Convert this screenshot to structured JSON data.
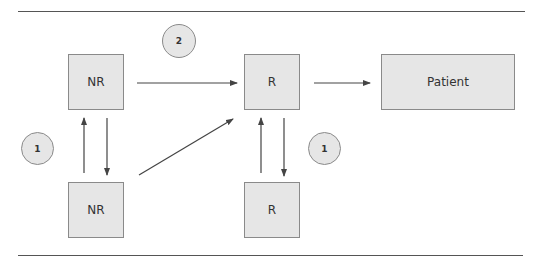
{
  "diagram": {
    "nodes": [
      {
        "id": "nr-top",
        "label": "NR"
      },
      {
        "id": "r-top",
        "label": "R"
      },
      {
        "id": "patient",
        "label": "Patient"
      },
      {
        "id": "nr-bottom",
        "label": "NR"
      },
      {
        "id": "r-bottom",
        "label": "R"
      }
    ],
    "badges": [
      {
        "id": "badge-2",
        "label": "2"
      },
      {
        "id": "badge-1-left",
        "label": "1"
      },
      {
        "id": "badge-1-right",
        "label": "1"
      }
    ],
    "edges": [
      {
        "from": "nr-top",
        "to": "r-top"
      },
      {
        "from": "r-top",
        "to": "patient"
      },
      {
        "from": "nr-bottom",
        "to": "nr-top"
      },
      {
        "from": "nr-top",
        "to": "nr-bottom"
      },
      {
        "from": "nr-bottom",
        "to": "r-top"
      },
      {
        "from": "r-bottom",
        "to": "r-top"
      },
      {
        "from": "r-top",
        "to": "r-bottom"
      }
    ],
    "colors": {
      "box_fill": "#e6e6e6",
      "box_border": "#8a8a8a",
      "line": "#444444"
    }
  }
}
